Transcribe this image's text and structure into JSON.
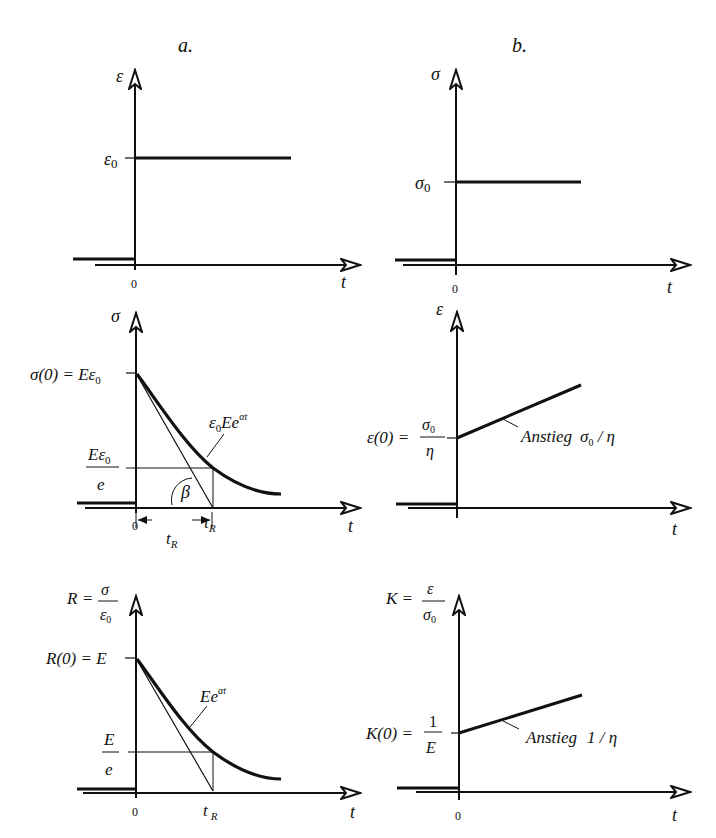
{
  "figure": {
    "columns": [
      {
        "id": "a",
        "label": "a."
      },
      {
        "id": "b",
        "label": "b."
      }
    ],
    "panels": {
      "a1": {
        "y_axis": "ε",
        "x_axis": "t",
        "origin": "0",
        "level_label": "ε0",
        "level_base": "ε",
        "level_sub": "0"
      },
      "b1": {
        "y_axis": "σ",
        "x_axis": "t",
        "origin": "0",
        "level_base": "σ",
        "level_sub": "0"
      },
      "a2": {
        "y_axis": "σ",
        "x_axis": "t",
        "origin": "0",
        "start_label_lhs": "σ(0) = Eε",
        "start_label_sub": "0",
        "e_fraction_num": "Eε",
        "e_fraction_num_sub": "0",
        "e_fraction_den": "e",
        "curve_label": "ε",
        "curve_label_sub": "0",
        "curve_label_mid": "Ee",
        "curve_label_sup": "αt",
        "angle_label": "β",
        "tau_label": "τ",
        "tau_sub": "R",
        "interval_label": "t",
        "interval_sub": "R"
      },
      "b2": {
        "y_axis": "ε",
        "x_axis": "t",
        "start_label_lhs": "ε(0) =",
        "start_frac_num": "σ",
        "start_frac_num_sub": "0",
        "start_frac_den": "η",
        "slope_label": "Anstieg",
        "slope_value": "σ",
        "slope_value_sub": "0",
        "slope_value_tail": " / η"
      },
      "a3": {
        "y_axis_lhs": "R =",
        "y_axis_frac_num": "σ",
        "y_axis_frac_den": "ε",
        "y_axis_frac_den_sub": "0",
        "x_axis": "t",
        "origin": "0",
        "start_label": "R(0) = E",
        "e_fraction_num": "E",
        "e_fraction_den": "e",
        "curve_label": "Ee",
        "curve_label_sup": "αt",
        "t_label": "t",
        "t_sub": "R"
      },
      "b3": {
        "y_axis_lhs": "K =",
        "y_axis_frac_num": "ε",
        "y_axis_frac_den": "σ",
        "y_axis_frac_den_sub": "0",
        "x_axis": "t",
        "origin": "0",
        "start_label_lhs": "K(0) =",
        "start_frac_num": "1",
        "start_frac_den": "E",
        "slope_label": "Anstieg",
        "slope_value": "1 / η"
      }
    }
  }
}
